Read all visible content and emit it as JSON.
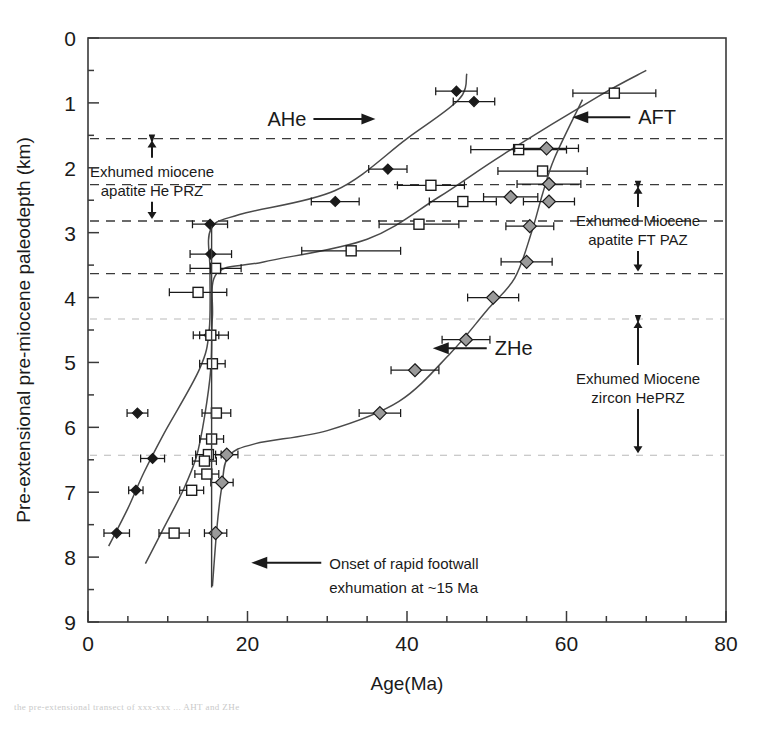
{
  "figure": {
    "background": "#ffffff",
    "ink": "#1a1a1a",
    "caption_strip": "the pre-extensional transect of xxx-xxx ... AHT and ZHe"
  },
  "chart_data": {
    "type": "scatter",
    "title": "",
    "xlabel": "Age(Ma)",
    "ylabel": "Pre-extensional pre-miocene paleodepth (km)",
    "xlim": [
      0,
      80
    ],
    "ylim": [
      9,
      0
    ],
    "y_inverted": true,
    "xticks": [
      0,
      20,
      40,
      60,
      80
    ],
    "xticklabels": [
      "0",
      "20",
      "40",
      "60",
      "80"
    ],
    "xminor_step": 5,
    "yticks": [
      0,
      1,
      2,
      3,
      4,
      5,
      6,
      7,
      8,
      9
    ],
    "yticklabels": [
      "0",
      "1",
      "2",
      "3",
      "4",
      "5",
      "6",
      "7",
      "8",
      "9"
    ],
    "yminor_step": 0.5,
    "grid": false,
    "legend": "inline-labels",
    "series": [
      {
        "name": "AHe",
        "marker": "filled-diamond",
        "color": "#1a1a1a",
        "points": [
          {
            "age": 46.2,
            "depth": 0.82,
            "err": 2.6
          },
          {
            "age": 48.4,
            "depth": 0.98,
            "err": 2.6
          },
          {
            "age": 37.6,
            "depth": 2.02,
            "err": 2.4
          },
          {
            "age": 31.0,
            "depth": 2.52,
            "err": 3.0
          },
          {
            "age": 15.3,
            "depth": 2.87,
            "err": 2.2
          },
          {
            "age": 15.4,
            "depth": 3.33,
            "err": 2.6
          },
          {
            "age": 15.2,
            "depth": 4.58,
            "err": 1.2
          },
          {
            "age": 6.2,
            "depth": 5.78,
            "err": 1.3
          },
          {
            "age": 8.1,
            "depth": 6.48,
            "err": 1.5
          },
          {
            "age": 6.0,
            "depth": 6.97,
            "err": 0.9
          },
          {
            "age": 3.6,
            "depth": 7.63,
            "err": 1.6
          }
        ]
      },
      {
        "name": "AFT",
        "marker": "open-square",
        "color": "#1a1a1a",
        "points": [
          {
            "age": 66.0,
            "depth": 0.85,
            "err": 5.2
          },
          {
            "age": 54.0,
            "depth": 1.72,
            "err": 6.0
          },
          {
            "age": 57.0,
            "depth": 2.05,
            "err": 5.6
          },
          {
            "age": 43.0,
            "depth": 2.27,
            "err": 4.2
          },
          {
            "age": 47.0,
            "depth": 2.52,
            "err": 4.2
          },
          {
            "age": 41.5,
            "depth": 2.87,
            "err": 5.0
          },
          {
            "age": 33.0,
            "depth": 3.28,
            "err": 6.2
          },
          {
            "age": 16.0,
            "depth": 3.55,
            "err": 3.2
          },
          {
            "age": 13.8,
            "depth": 3.92,
            "err": 3.6
          },
          {
            "age": 15.4,
            "depth": 4.58,
            "err": 2.2
          },
          {
            "age": 15.6,
            "depth": 5.02,
            "err": 1.6
          },
          {
            "age": 16.1,
            "depth": 5.78,
            "err": 1.8
          },
          {
            "age": 15.5,
            "depth": 6.18,
            "err": 1.5
          },
          {
            "age": 15.1,
            "depth": 6.42,
            "err": 1.6
          },
          {
            "age": 14.6,
            "depth": 6.52,
            "err": 1.5
          },
          {
            "age": 14.9,
            "depth": 6.72,
            "err": 1.5
          },
          {
            "age": 13.0,
            "depth": 6.97,
            "err": 1.5
          },
          {
            "age": 10.8,
            "depth": 7.63,
            "err": 1.9
          }
        ]
      },
      {
        "name": "ZHe",
        "marker": "grey-diamond",
        "color": "#8e8e8e",
        "points": [
          {
            "age": 57.5,
            "depth": 1.7,
            "err": 4.0
          },
          {
            "age": 57.8,
            "depth": 2.25,
            "err": 4.0
          },
          {
            "age": 53.0,
            "depth": 2.45,
            "err": 3.4
          },
          {
            "age": 57.8,
            "depth": 2.52,
            "err": 3.2
          },
          {
            "age": 55.4,
            "depth": 2.9,
            "err": 3.0
          },
          {
            "age": 55.0,
            "depth": 3.45,
            "err": 3.2
          },
          {
            "age": 50.8,
            "depth": 4.0,
            "err": 3.2
          },
          {
            "age": 47.4,
            "depth": 4.65,
            "err": 3.0
          },
          {
            "age": 41.0,
            "depth": 5.12,
            "err": 3.0
          },
          {
            "age": 36.6,
            "depth": 5.78,
            "err": 2.6
          },
          {
            "age": 17.4,
            "depth": 6.42,
            "err": 1.4
          },
          {
            "age": 16.8,
            "depth": 6.85,
            "err": 1.4
          },
          {
            "age": 16.0,
            "depth": 7.63,
            "err": 1.4
          }
        ]
      }
    ],
    "zone_bands": [
      {
        "label": "Exhumed miocene apatite He PRZ",
        "label_lines": [
          "Exhumed miocene",
          "apatite He PRZ"
        ],
        "top_depth": 1.55,
        "bottom_depth": 2.82,
        "style": "dashed-dark"
      },
      {
        "label": "Exhumed Miocene apatite FT PAZ",
        "label_lines": [
          "Exhumed Miocene",
          "apatite FT PAZ"
        ],
        "top_depth": 2.26,
        "bottom_depth": 3.63,
        "style": "dashed-dark"
      },
      {
        "label": "Exhumed Miocene zircon HePRZ",
        "label_lines": [
          "Exhumed Miocene",
          "zircon HePRZ"
        ],
        "top_depth": 4.33,
        "bottom_depth": 6.43,
        "style": "dashed-light"
      }
    ],
    "annotations": [
      {
        "name": "ahe-label",
        "text": "AHe",
        "age": 22.5,
        "depth": 1.25,
        "arrow": "right"
      },
      {
        "name": "aft-label",
        "text": "AFT",
        "age": 69.0,
        "depth": 1.22,
        "arrow": "left"
      },
      {
        "name": "zhe-label",
        "text": "ZHe",
        "age": 50.5,
        "depth": 4.78,
        "arrow": "left"
      },
      {
        "name": "onset-label",
        "line1": "Onset of rapid footwall",
        "line2": "exhumation at ~15 Ma",
        "age": 29.5,
        "depth": 8.18,
        "arrow": "left"
      }
    ]
  }
}
